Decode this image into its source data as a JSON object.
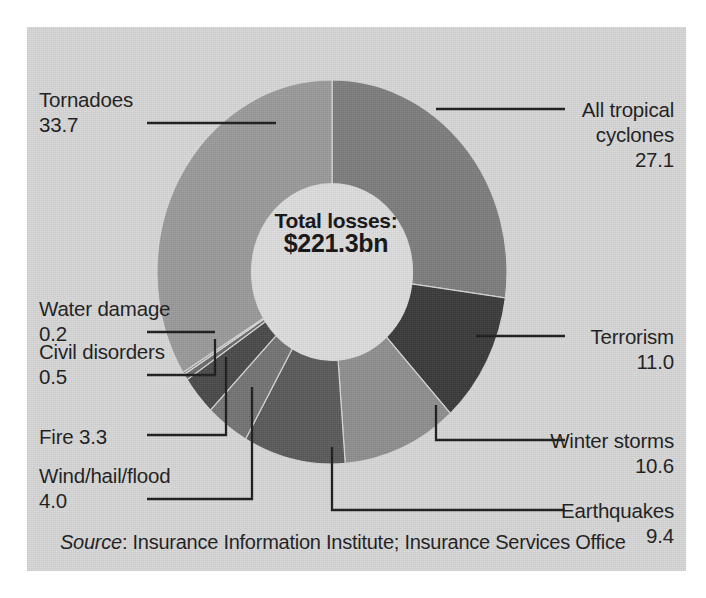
{
  "figure": {
    "background_color": "#d8d8d8",
    "center": {
      "line1": "Total losses:",
      "line2": "$221.3bn"
    },
    "source": {
      "prefix": "Source",
      "rest": ": Insurance Information Institute; Insurance Services Office"
    }
  },
  "chart_data": {
    "type": "pie",
    "title": "",
    "subtitle": "",
    "xlabel": "",
    "ylabel": "",
    "legend_position": "callout-labels",
    "donut": true,
    "inner_radius_ratio": 0.46,
    "start_angle_deg": 0,
    "direction": "clockwise",
    "total_label": "Total losses: $221.3bn",
    "total_value": 221.3,
    "unit": "percent",
    "categories": [
      "All tropical cyclones",
      "Terrorism",
      "Winter storms",
      "Earthquakes",
      "Wind/hail/flood",
      "Fire",
      "Civil disorders",
      "Water damage",
      "Tornadoes"
    ],
    "values": [
      27.1,
      11.0,
      10.6,
      9.4,
      4.0,
      3.3,
      0.5,
      0.2,
      33.7
    ],
    "colors": [
      "#7e7e7e",
      "#3a3a3a",
      "#8f8f8f",
      "#5a5a5a",
      "#747474",
      "#4a4a4a",
      "#6a6a6a",
      "#8a8a8a",
      "#9b9b9b"
    ]
  },
  "labels": [
    {
      "id": "all-tropical-cyclones",
      "name": "All tropical",
      "name2": "cyclones",
      "value": "27.1"
    },
    {
      "id": "terrorism",
      "name": "Terrorism",
      "value": "11.0"
    },
    {
      "id": "winter-storms",
      "name": "Winter storms",
      "value": "10.6"
    },
    {
      "id": "earthquakes",
      "name": "Earthquakes",
      "value": "9.4"
    },
    {
      "id": "tornadoes",
      "name": "Tornadoes",
      "value": "33.7"
    },
    {
      "id": "water-damage",
      "name": "Water damage",
      "value": "0.2"
    },
    {
      "id": "civil-disorders",
      "name": "Civil disorders",
      "value": "0.5"
    },
    {
      "id": "fire",
      "name": "Fire 3.3",
      "value": "3.3"
    },
    {
      "id": "wind-hail-flood",
      "name": "Wind/hail/flood",
      "value": "4.0"
    }
  ]
}
